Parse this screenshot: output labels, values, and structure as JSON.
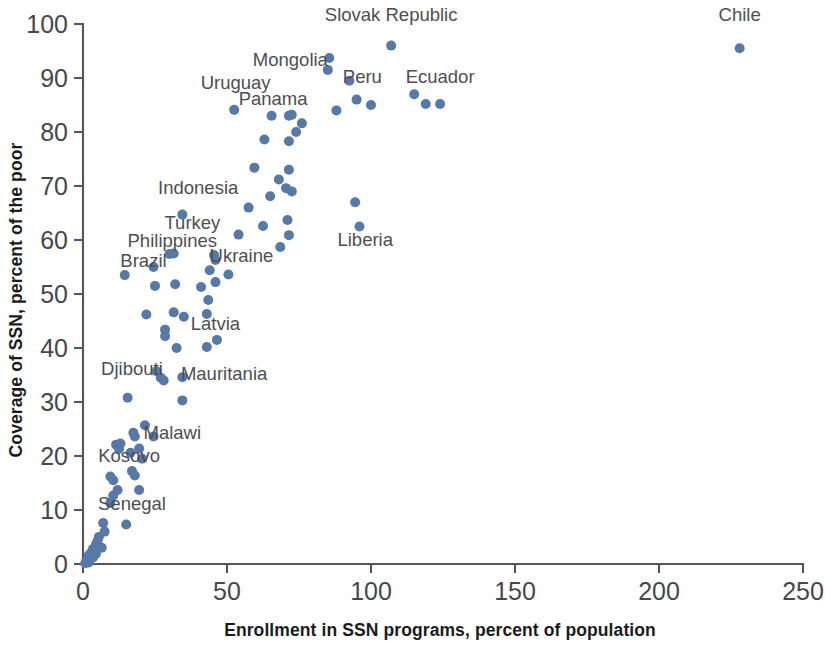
{
  "chart_data": {
    "type": "scatter",
    "title": "",
    "xlabel": "Enrollment in SSN programs, percent of population",
    "ylabel": "Coverage of SSN, percent of the poor",
    "xlim": [
      0,
      250
    ],
    "ylim": [
      0,
      100
    ],
    "xticks": [
      0,
      50,
      100,
      150,
      200,
      250
    ],
    "yticks": [
      0,
      10,
      20,
      30,
      40,
      50,
      60,
      70,
      80,
      90,
      100
    ],
    "xtick_labels": [
      "0",
      "50",
      "100",
      "150",
      "200",
      "250"
    ],
    "ytick_labels": [
      "0",
      "10",
      "20",
      "30",
      "40",
      "50",
      "60",
      "70",
      "80",
      "90",
      "100"
    ],
    "grid": false,
    "legend": false,
    "marker_color": "#5878a6",
    "marker_size": 5,
    "annotations": [
      {
        "text": "Slovak Republic",
        "x": 107,
        "y": 100.5,
        "anchor": "middle"
      },
      {
        "text": "Chile",
        "x": 228,
        "y": 100.5,
        "anchor": "middle"
      },
      {
        "text": "Mongolia",
        "x": 72,
        "y": 92.2,
        "anchor": "middle"
      },
      {
        "text": "Ecuador",
        "x": 124,
        "y": 89.0,
        "anchor": "middle"
      },
      {
        "text": "Peru",
        "x": 97,
        "y": 89.0,
        "anchor": "middle"
      },
      {
        "text": "Uruguay",
        "x": 53,
        "y": 88.0,
        "anchor": "middle"
      },
      {
        "text": "Panama",
        "x": 66,
        "y": 85.0,
        "anchor": "middle"
      },
      {
        "text": "Indonesia",
        "x": 40,
        "y": 68.5,
        "anchor": "middle"
      },
      {
        "text": "Turkey",
        "x": 38,
        "y": 62.0,
        "anchor": "middle"
      },
      {
        "text": "Liberia",
        "x": 98,
        "y": 58.8,
        "anchor": "middle"
      },
      {
        "text": "Philippines",
        "x": 31,
        "y": 58.7,
        "anchor": "middle"
      },
      {
        "text": "Ukraine",
        "x": 55,
        "y": 56.0,
        "anchor": "middle"
      },
      {
        "text": "Brazil",
        "x": 21,
        "y": 55.0,
        "anchor": "middle"
      },
      {
        "text": "Latvia",
        "x": 46,
        "y": 43.3,
        "anchor": "middle"
      },
      {
        "text": "Djibouti",
        "x": 17,
        "y": 35.0,
        "anchor": "middle"
      },
      {
        "text": "Mauritania",
        "x": 49,
        "y": 34.0,
        "anchor": "middle"
      },
      {
        "text": "Malawi",
        "x": 31,
        "y": 23.2,
        "anchor": "middle"
      },
      {
        "text": "Kosovo",
        "x": 16,
        "y": 18.8,
        "anchor": "middle"
      },
      {
        "text": "Senegal",
        "x": 17,
        "y": 10.0,
        "anchor": "middle"
      }
    ],
    "points": [
      {
        "x": 228.0,
        "y": 95.5
      },
      {
        "x": 107.0,
        "y": 96.0
      },
      {
        "x": 85.5,
        "y": 93.7
      },
      {
        "x": 85.0,
        "y": 91.5
      },
      {
        "x": 92.5,
        "y": 89.5
      },
      {
        "x": 115.0,
        "y": 87.0
      },
      {
        "x": 95.0,
        "y": 86.0
      },
      {
        "x": 119.0,
        "y": 85.2
      },
      {
        "x": 124.0,
        "y": 85.2
      },
      {
        "x": 100.0,
        "y": 85.0
      },
      {
        "x": 52.5,
        "y": 84.1
      },
      {
        "x": 88.0,
        "y": 84.0
      },
      {
        "x": 65.5,
        "y": 83.0
      },
      {
        "x": 71.5,
        "y": 83.0
      },
      {
        "x": 72.5,
        "y": 83.2
      },
      {
        "x": 76.0,
        "y": 81.6
      },
      {
        "x": 74.0,
        "y": 80.0
      },
      {
        "x": 63.0,
        "y": 78.6
      },
      {
        "x": 71.5,
        "y": 78.3
      },
      {
        "x": 59.5,
        "y": 73.4
      },
      {
        "x": 71.5,
        "y": 73.0
      },
      {
        "x": 68.0,
        "y": 71.2
      },
      {
        "x": 70.5,
        "y": 69.6
      },
      {
        "x": 72.5,
        "y": 69.0
      },
      {
        "x": 65.0,
        "y": 68.1
      },
      {
        "x": 94.5,
        "y": 67.0
      },
      {
        "x": 57.5,
        "y": 66.0
      },
      {
        "x": 34.5,
        "y": 64.7
      },
      {
        "x": 71.0,
        "y": 63.7
      },
      {
        "x": 62.5,
        "y": 62.6
      },
      {
        "x": 96.0,
        "y": 62.5
      },
      {
        "x": 54.0,
        "y": 61.0
      },
      {
        "x": 71.5,
        "y": 60.9
      },
      {
        "x": 68.5,
        "y": 58.7
      },
      {
        "x": 30.0,
        "y": 57.4
      },
      {
        "x": 31.5,
        "y": 57.5
      },
      {
        "x": 45.5,
        "y": 57.2
      },
      {
        "x": 46.0,
        "y": 56.3
      },
      {
        "x": 24.5,
        "y": 55.0
      },
      {
        "x": 44.0,
        "y": 54.4
      },
      {
        "x": 50.5,
        "y": 53.6
      },
      {
        "x": 14.5,
        "y": 53.5
      },
      {
        "x": 46.0,
        "y": 52.2
      },
      {
        "x": 25.0,
        "y": 51.5
      },
      {
        "x": 32.0,
        "y": 51.8
      },
      {
        "x": 41.0,
        "y": 51.3
      },
      {
        "x": 43.5,
        "y": 48.9
      },
      {
        "x": 43.0,
        "y": 46.3
      },
      {
        "x": 22.0,
        "y": 46.2
      },
      {
        "x": 31.5,
        "y": 46.6
      },
      {
        "x": 35.0,
        "y": 45.8
      },
      {
        "x": 28.5,
        "y": 43.4
      },
      {
        "x": 28.5,
        "y": 42.2
      },
      {
        "x": 46.5,
        "y": 41.5
      },
      {
        "x": 43.0,
        "y": 40.2
      },
      {
        "x": 32.5,
        "y": 40.0
      },
      {
        "x": 25.5,
        "y": 35.7
      },
      {
        "x": 27.0,
        "y": 34.5
      },
      {
        "x": 28.0,
        "y": 34.0
      },
      {
        "x": 34.5,
        "y": 34.6
      },
      {
        "x": 15.5,
        "y": 30.8
      },
      {
        "x": 34.5,
        "y": 30.3
      },
      {
        "x": 21.5,
        "y": 25.7
      },
      {
        "x": 17.5,
        "y": 24.3
      },
      {
        "x": 18.0,
        "y": 23.6
      },
      {
        "x": 24.5,
        "y": 23.6
      },
      {
        "x": 11.5,
        "y": 22.1
      },
      {
        "x": 13.0,
        "y": 22.3
      },
      {
        "x": 12.5,
        "y": 21.3
      },
      {
        "x": 19.5,
        "y": 21.4
      },
      {
        "x": 16.5,
        "y": 20.6
      },
      {
        "x": 20.5,
        "y": 19.5
      },
      {
        "x": 17.0,
        "y": 17.2
      },
      {
        "x": 18.0,
        "y": 16.4
      },
      {
        "x": 9.5,
        "y": 16.2
      },
      {
        "x": 10.5,
        "y": 15.5
      },
      {
        "x": 12.0,
        "y": 13.7
      },
      {
        "x": 19.5,
        "y": 13.7
      },
      {
        "x": 10.5,
        "y": 12.7
      },
      {
        "x": 9.5,
        "y": 11.3
      },
      {
        "x": 7.0,
        "y": 7.6
      },
      {
        "x": 15.0,
        "y": 7.3
      },
      {
        "x": 7.5,
        "y": 6.0
      },
      {
        "x": 5.5,
        "y": 5.0
      },
      {
        "x": 5.0,
        "y": 4.2
      },
      {
        "x": 4.5,
        "y": 3.6
      },
      {
        "x": 6.5,
        "y": 3.0
      },
      {
        "x": 3.5,
        "y": 2.8
      },
      {
        "x": 3.0,
        "y": 2.2
      },
      {
        "x": 4.5,
        "y": 1.9
      },
      {
        "x": 2.0,
        "y": 1.6
      },
      {
        "x": 3.5,
        "y": 1.2
      },
      {
        "x": 2.5,
        "y": 0.9
      },
      {
        "x": 1.5,
        "y": 0.7
      },
      {
        "x": 1.0,
        "y": 0.4
      },
      {
        "x": 2.0,
        "y": 0.3
      },
      {
        "x": 0.8,
        "y": 0.15
      }
    ]
  }
}
